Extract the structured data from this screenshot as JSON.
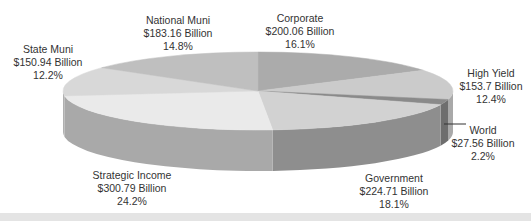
{
  "chart_data": {
    "type": "pie",
    "style": "3d-pie",
    "title": "",
    "unit": "Billion USD",
    "start_angle_deg": 0,
    "direction": "clockwise",
    "slices": [
      {
        "label": "Corporate",
        "value": 200.06,
        "value_text": "$200.06 Billion",
        "percent": 16.1,
        "percent_text": "16.1%",
        "top_color": "#ababab",
        "side_color": "#8f8f8f"
      },
      {
        "label": "High Yield",
        "value": 153.7,
        "value_text": "$153.7 Billion",
        "percent": 12.4,
        "percent_text": "12.4%",
        "top_color": "#cbcbcb",
        "side_color": "#a9a9a9"
      },
      {
        "label": "World",
        "value": 27.56,
        "value_text": "$27.56 Billion",
        "percent": 2.2,
        "percent_text": "2.2%",
        "top_color": "#8a8a8a",
        "side_color": "#6e6e6e"
      },
      {
        "label": "Government",
        "value": 224.71,
        "value_text": "$224.71 Billion",
        "percent": 18.1,
        "percent_text": "18.1%",
        "top_color": "#d2d2d2",
        "side_color": "#8e8e8e"
      },
      {
        "label": "Strategic Income",
        "value": 300.79,
        "value_text": "$300.79 Billion",
        "percent": 24.2,
        "percent_text": "24.2%",
        "top_color": "#eaeaea",
        "side_color": "#a9a9a9"
      },
      {
        "label": "State Muni",
        "value": 150.94,
        "value_text": "$150.94 Billion",
        "percent": 12.2,
        "percent_text": "12.2%",
        "top_color": "#d8d8d8",
        "side_color": "#b0b0b0"
      },
      {
        "label": "National Muni",
        "value": 183.16,
        "value_text": "$183.16 Billion",
        "percent": 14.8,
        "percent_text": "14.8%",
        "top_color": "#bfbfbf",
        "side_color": "#9c9c9c"
      }
    ],
    "legend": "none (direct labels)"
  },
  "labels": [
    {
      "name": "corporate",
      "x": 300,
      "y": 12,
      "leader": false
    },
    {
      "name": "high-yield",
      "x": 491,
      "y": 67,
      "leader": false
    },
    {
      "name": "world",
      "x": 483,
      "y": 124,
      "leader": true
    },
    {
      "name": "government",
      "x": 394,
      "y": 172,
      "leader": false
    },
    {
      "name": "strategic-income",
      "x": 132,
      "y": 169,
      "leader": false
    },
    {
      "name": "state-muni",
      "x": 48,
      "y": 43,
      "leader": false
    },
    {
      "name": "national-muni",
      "x": 178,
      "y": 14,
      "leader": false
    }
  ],
  "geometry": {
    "cx": 258,
    "cy": 91,
    "rx": 195,
    "ry": 39,
    "depth": 41
  }
}
